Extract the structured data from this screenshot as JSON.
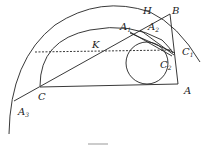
{
  "labels": {
    "H": "H",
    "B": "B",
    "A1": "A",
    "A1_sub": "1",
    "A2": "A",
    "A2_sub": "2",
    "K": "K",
    "C1": "C",
    "C1_sub": "1",
    "C2": "C",
    "C2_sub": "2",
    "A": "A",
    "C": "C",
    "A3": "A",
    "A3_sub": "3"
  },
  "colors": {
    "stroke": "#222222",
    "background": "#ffffff"
  }
}
